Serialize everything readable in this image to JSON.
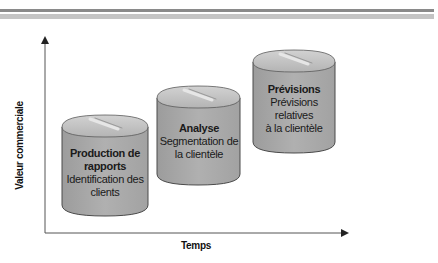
{
  "header": {
    "rule_colors": [
      "#8a8a8a",
      "#c4c4c4"
    ]
  },
  "axes": {
    "y_label": "Valeur commerciale",
    "x_label": "Temps"
  },
  "colors": {
    "cylinder_body": "#a8a8a8",
    "cylinder_top": "#bdbdbd",
    "cylinder_outline": "#4a4a4a",
    "axis": "#333333"
  },
  "stages": [
    {
      "title": "Production de rapports",
      "title_lines": [
        "Production de",
        "rapports"
      ],
      "description_lines": [
        "Identification des",
        "clients"
      ]
    },
    {
      "title": "Analyse",
      "title_lines": [
        "Analyse"
      ],
      "description_lines": [
        "Segmentation de",
        "la clientèle"
      ]
    },
    {
      "title": "Prévisions",
      "title_lines": [
        "Prévisions"
      ],
      "description_lines": [
        "Prévisions",
        "relatives",
        "à la clientèle"
      ]
    }
  ]
}
